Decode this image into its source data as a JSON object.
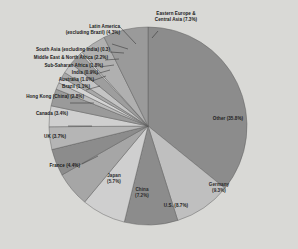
{
  "chart_data": {
    "type": "pie",
    "title": "",
    "subtitle": "",
    "xlabel": "",
    "ylabel": "",
    "legend_position": "callout-labels",
    "grid": false,
    "units": "percent",
    "start_angle_deg": 0,
    "direction": "clockwise",
    "categories": [
      "Other",
      "Germany",
      "U.S.",
      "China",
      "Japan",
      "France",
      "UK",
      "Canada",
      "Hong Kong (China)",
      "Brazil",
      "Australia",
      "India",
      "Sub-Saharan Africa",
      "Middle East & North Africa",
      "South Asia (excluding India)",
      "Latin America (excluding Brazil)",
      "Eastern Europe & Central Asia"
    ],
    "values": [
      35.8,
      9.3,
      8.7,
      7.2,
      5.7,
      4.4,
      3.7,
      3.4,
      2.8,
      1.1,
      1.0,
      0.9,
      1.8,
      2.2,
      0.3,
      4.3,
      7.3
    ],
    "colors": [
      "#8c8c8c",
      "#bfbfbf",
      "#8c8c8c",
      "#cfcfcf",
      "#a6a6a6",
      "#8c8c8c",
      "#b5b5b5",
      "#cfcfcf",
      "#9a9a9a",
      "#bdbdbd",
      "#d4d4d4",
      "#a8a8a8",
      "#c4c4c4",
      "#9e9e9e",
      "#d8d8d8",
      "#b0b0b0",
      "#9a9a9a"
    ],
    "slices": [
      {
        "label": "Other",
        "value": 35.8,
        "display": "Other (35.8%)"
      },
      {
        "label": "Germany",
        "value": 9.3,
        "display": "Germany (9.3%)"
      },
      {
        "label": "U.S.",
        "value": 8.7,
        "display": "U.S. (8.7%)"
      },
      {
        "label": "China",
        "value": 7.2,
        "display": "China (7.2%)"
      },
      {
        "label": "Japan",
        "value": 5.7,
        "display": "Japan (5.7%)"
      },
      {
        "label": "France",
        "value": 4.4,
        "display": "France (4.4%)"
      },
      {
        "label": "UK",
        "value": 3.7,
        "display": "UK (3.7%)"
      },
      {
        "label": "Canada",
        "value": 3.4,
        "display": "Canada (3.4%)"
      },
      {
        "label": "Hong Kong (China)",
        "value": 2.8,
        "display": "Hong Kong (China) (2.8%)"
      },
      {
        "label": "Brazil",
        "value": 1.1,
        "display": "Brazil (1.1%)"
      },
      {
        "label": "Australia",
        "value": 1.0,
        "display": "Australia (1.0%)"
      },
      {
        "label": "India",
        "value": 0.9,
        "display": "India (0.9%)"
      },
      {
        "label": "Sub-Saharan Africa",
        "value": 1.8,
        "display": "Sub-Saharan Africa (1.8%)"
      },
      {
        "label": "Middle East & North Africa",
        "value": 2.2,
        "display": "Middle East & North Africa (2.2%)"
      },
      {
        "label": "South Asia (excluding India)",
        "value": 0.3,
        "display": "South Asia (excluding India) (0.3)"
      },
      {
        "label": "Latin America (excluding Brazil)",
        "value": 4.3,
        "display": "Latin America (excluding Brazil) (4.3%)"
      },
      {
        "label": "Eastern Europe & Central Asia",
        "value": 7.3,
        "display": "Eastern Europe & Central Asia (7.3%)"
      }
    ]
  },
  "labels": {
    "other": "Other (35.8%)",
    "germany_line1": "Germany",
    "germany_line2": "(9.3%)",
    "us": "U.S. (8.7%)",
    "china_line1": "China",
    "china_line2": "(7.2%)",
    "japan_line1": "Japan",
    "japan_line2": "(5.7%)",
    "france": "France (4.4%)",
    "uk": "UK (3.7%)",
    "canada": "Canada (3.4%)",
    "hongkong": "Hong Kong (China) (2.8%)",
    "brazil": "Brazil (1.1%)",
    "australia": "Australia (1.0%)",
    "india": "India (0.9%)",
    "subsaharan": "Sub-Saharan Africa (1.8%)",
    "mena": "Middle East & North Africa (2.2%)",
    "southasia": "South Asia (excluding India) (0.3)",
    "latam_line1": "Latin America",
    "latam_line2": "(excluding Brazil) (4.3%)",
    "eeca_line1": "Eastern Europe &",
    "eeca_line2": "Central Asia (7.3%)"
  },
  "style": {
    "background": "#d9d9d6",
    "outline": "#5a5a5a",
    "leader_line": "#2b2b2b"
  }
}
